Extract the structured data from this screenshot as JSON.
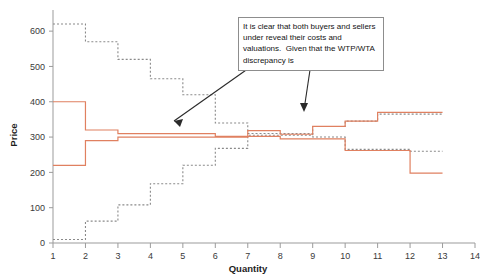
{
  "chart_data": {
    "type": "line",
    "title": "",
    "xlabel": "Quantity",
    "ylabel": "Price",
    "xlim": [
      1,
      14
    ],
    "ylim": [
      0,
      640
    ],
    "grid": false,
    "legend_position": "none",
    "x_ticks": [
      1,
      2,
      3,
      4,
      5,
      6,
      7,
      8,
      9,
      10,
      11,
      12,
      13,
      14
    ],
    "y_ticks": [
      0,
      100,
      200,
      300,
      400,
      500,
      600
    ],
    "series": [
      {
        "name": "True demand (dotted, descending)",
        "style": "dotted-step",
        "color": "#8a8a8a",
        "steps": [
          {
            "x_start": 1,
            "x_end": 2,
            "value": 620
          },
          {
            "x_start": 2,
            "x_end": 3,
            "value": 570
          },
          {
            "x_start": 3,
            "x_end": 4,
            "value": 520
          },
          {
            "x_start": 4,
            "x_end": 5,
            "value": 465
          },
          {
            "x_start": 5,
            "x_end": 6,
            "value": 420
          },
          {
            "x_start": 6,
            "x_end": 7,
            "value": 340
          },
          {
            "x_start": 7,
            "x_end": 8,
            "value": 310
          },
          {
            "x_start": 8,
            "x_end": 9,
            "value": 310
          },
          {
            "x_start": 9,
            "x_end": 10,
            "value": 300
          },
          {
            "x_start": 10,
            "x_end": 11,
            "value": 265
          },
          {
            "x_start": 11,
            "x_end": 12,
            "value": 265
          },
          {
            "x_start": 12,
            "x_end": 13,
            "value": 260
          }
        ]
      },
      {
        "name": "True supply (dotted, ascending)",
        "style": "dotted-step",
        "color": "#8a8a8a",
        "steps": [
          {
            "x_start": 1,
            "x_end": 2,
            "value": 10
          },
          {
            "x_start": 2,
            "x_end": 3,
            "value": 62
          },
          {
            "x_start": 3,
            "x_end": 4,
            "value": 108
          },
          {
            "x_start": 4,
            "x_end": 5,
            "value": 168
          },
          {
            "x_start": 5,
            "x_end": 6,
            "value": 220
          },
          {
            "x_start": 6,
            "x_end": 7,
            "value": 268
          },
          {
            "x_start": 7,
            "x_end": 8,
            "value": 305
          },
          {
            "x_start": 8,
            "x_end": 9,
            "value": 305
          },
          {
            "x_start": 9,
            "x_end": 10,
            "value": 330
          },
          {
            "x_start": 10,
            "x_end": 11,
            "value": 345
          },
          {
            "x_start": 11,
            "x_end": 12,
            "value": 365
          },
          {
            "x_start": 12,
            "x_end": 13,
            "value": 365
          }
        ]
      },
      {
        "name": "Revealed demand (solid, descending)",
        "style": "solid-step",
        "color": "#e08060",
        "steps": [
          {
            "x_start": 1,
            "x_end": 2,
            "value": 400
          },
          {
            "x_start": 2,
            "x_end": 3,
            "value": 320
          },
          {
            "x_start": 3,
            "x_end": 4,
            "value": 310
          },
          {
            "x_start": 4,
            "x_end": 5,
            "value": 310
          },
          {
            "x_start": 5,
            "x_end": 6,
            "value": 310
          },
          {
            "x_start": 6,
            "x_end": 7,
            "value": 302
          },
          {
            "x_start": 7,
            "x_end": 8,
            "value": 302
          },
          {
            "x_start": 8,
            "x_end": 9,
            "value": 295
          },
          {
            "x_start": 9,
            "x_end": 10,
            "value": 295
          },
          {
            "x_start": 10,
            "x_end": 11,
            "value": 262
          },
          {
            "x_start": 11,
            "x_end": 12,
            "value": 262
          },
          {
            "x_start": 12,
            "x_end": 13,
            "value": 198
          }
        ]
      },
      {
        "name": "Revealed supply (solid, ascending)",
        "style": "solid-step",
        "color": "#e08060",
        "steps": [
          {
            "x_start": 1,
            "x_end": 2,
            "value": 220
          },
          {
            "x_start": 2,
            "x_end": 3,
            "value": 290
          },
          {
            "x_start": 3,
            "x_end": 4,
            "value": 300
          },
          {
            "x_start": 4,
            "x_end": 5,
            "value": 300
          },
          {
            "x_start": 5,
            "x_end": 6,
            "value": 300
          },
          {
            "x_start": 6,
            "x_end": 7,
            "value": 300
          },
          {
            "x_start": 7,
            "x_end": 8,
            "value": 318
          },
          {
            "x_start": 8,
            "x_end": 9,
            "value": 308
          },
          {
            "x_start": 9,
            "x_end": 10,
            "value": 330
          },
          {
            "x_start": 10,
            "x_end": 11,
            "value": 345
          },
          {
            "x_start": 11,
            "x_end": 12,
            "value": 370
          },
          {
            "x_start": 12,
            "x_end": 13,
            "value": 370
          }
        ]
      }
    ],
    "annotations": [
      {
        "name": "discrepancy-note",
        "text": "It is clear that both buyers and sellers under reveal their costs and valuations.  Given that the WTP/WTA discrepancy is",
        "boxed": true
      }
    ]
  }
}
